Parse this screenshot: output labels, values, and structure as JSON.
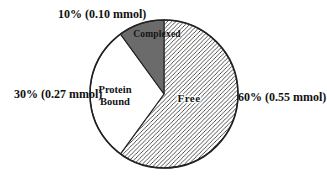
{
  "chart_data": {
    "type": "pie",
    "title": "",
    "unit": "mmol",
    "start_angle_deg": 0,
    "direction": "clockwise",
    "outline_color": "#222222",
    "background": "#ffffff",
    "hatch_color": "#1a1a1a",
    "hatch_direction": "/",
    "slices": [
      {
        "name": "Free",
        "pct": 60,
        "mmol": 0.55,
        "callout": "60% (0.55 mmol)",
        "fill": "hatch"
      },
      {
        "name": "Protein Bound",
        "pct": 30,
        "mmol": 0.27,
        "callout": "30% (0.27 mmol)",
        "fill": "#ffffff"
      },
      {
        "name": "Complexed",
        "pct": 10,
        "mmol": 0.1,
        "callout": "10% (0.10 mmol)",
        "fill": "#6b6b6b"
      }
    ]
  }
}
